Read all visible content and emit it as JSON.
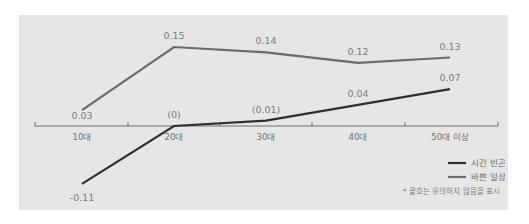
{
  "chart_data": {
    "type": "line",
    "title": "",
    "xlabel": "",
    "ylabel": "",
    "categories": [
      "10대",
      "20대",
      "30대",
      "40대",
      "50대 이상"
    ],
    "series": [
      {
        "name": "바쁜 일상",
        "color": "#6b6b6b",
        "values": [
          0.03,
          0.15,
          0.14,
          0.12,
          0.13
        ],
        "labels": [
          "0.03",
          "0.15",
          "0.14",
          "0.12",
          "0.13"
        ]
      },
      {
        "name": "시간 빈곤",
        "color": "#2f2f2f",
        "values": [
          -0.11,
          0,
          0.01,
          0.04,
          0.07
        ],
        "labels": [
          "-0.11",
          "(0)",
          "(0.01)",
          "0.04",
          "0.07"
        ]
      }
    ],
    "ylim": [
      -0.12,
      0.17
    ],
    "grid": false,
    "legend_position": "bottom-right",
    "legend": [
      "시간 빈곤",
      "바쁜 일상"
    ],
    "annotation": "* 괄호는 유의하지 않음을 표시"
  },
  "colors": {
    "background": "#e6e6e6",
    "axis": "#6f6f6f"
  }
}
